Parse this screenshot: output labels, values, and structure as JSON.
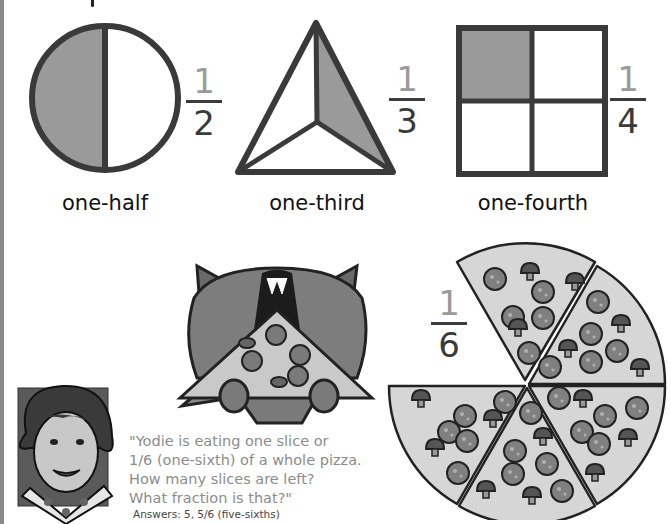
{
  "colors": {
    "shaded_fill": "#9a9a9a",
    "outline": "#3a3a3a",
    "numerator": "#9a9a9a",
    "denominator": "#3a3a3a",
    "quote_text": "#8c8c8c",
    "left_bar": "#8a8a8a"
  },
  "shapes": [
    {
      "id": "circle",
      "label": "one-half",
      "fraction": {
        "numerator": "1",
        "denominator": "2"
      },
      "parts": 2,
      "shaded_parts": 1,
      "icon": "circle-halves-icon"
    },
    {
      "id": "triangle",
      "label": "one-third",
      "fraction": {
        "numerator": "1",
        "denominator": "3"
      },
      "parts": 3,
      "shaded_parts": 1,
      "icon": "triangle-thirds-icon"
    },
    {
      "id": "square",
      "label": "one-fourth",
      "fraction": {
        "numerator": "1",
        "denominator": "4"
      },
      "parts": 4,
      "shaded_parts": 1,
      "icon": "square-quarters-icon"
    }
  ],
  "pizza": {
    "fraction": {
      "numerator": "1",
      "denominator": "6"
    },
    "total_slices": 6,
    "slices_remaining": 6,
    "icon": "pizza-icon"
  },
  "characters": {
    "raccoon": {
      "name": "Yodie",
      "icon": "raccoon-eating-pizza-icon"
    },
    "teacher": {
      "icon": "teacher-avatar-icon"
    }
  },
  "quote": {
    "lines": [
      "\"Yodie is eating one slice or",
      "1/6 (one-sixth) of a whole pizza.",
      "How many slices are left?",
      "What fraction is that?\""
    ]
  },
  "answers": {
    "text": "Answers: 5,  5/6 (five-sixths)"
  }
}
